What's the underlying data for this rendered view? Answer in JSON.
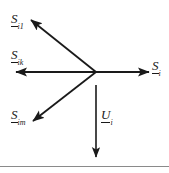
{
  "figure": {
    "type": "phasor-vector-diagram",
    "width": 169,
    "height": 173,
    "background_color": "#ffffff",
    "stroke_color": "#1a1a1a",
    "rule_color": "#8a8a8a",
    "origin": {
      "x": 96,
      "y": 72
    },
    "baseline_rule_y": 166
  },
  "vectors": [
    {
      "id": "s-i1",
      "symbol": "S",
      "subscript": "i1",
      "label_x": 11,
      "label_y": 10,
      "from_x": 96,
      "from_y": 72,
      "to_x": 31,
      "to_y": 20,
      "direction": "upper-left"
    },
    {
      "id": "s-ik",
      "symbol": "S",
      "subscript": "ik",
      "label_x": 11,
      "label_y": 46,
      "from_x": 96,
      "from_y": 72,
      "to_x": 15,
      "to_y": 72,
      "direction": "left"
    },
    {
      "id": "s-im",
      "symbol": "S",
      "subscript": "im",
      "label_x": 11,
      "label_y": 106,
      "from_x": 96,
      "from_y": 72,
      "to_x": 33,
      "to_y": 121,
      "direction": "lower-left"
    },
    {
      "id": "s-i",
      "symbol": "S",
      "subscript": "i",
      "label_x": 152,
      "label_y": 57,
      "from_x": 96,
      "from_y": 72,
      "to_x": 150,
      "to_y": 72,
      "direction": "right"
    },
    {
      "id": "u-i",
      "symbol": "U",
      "subscript": "i",
      "label_x": 101,
      "label_y": 106,
      "from_x": 96,
      "from_y": 85,
      "to_x": 96,
      "to_y": 158,
      "direction": "down"
    }
  ]
}
